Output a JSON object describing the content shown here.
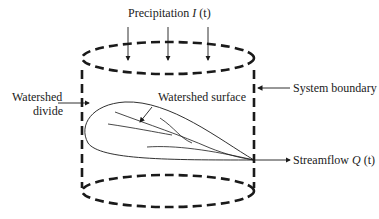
{
  "diagram": {
    "type": "watershed-system",
    "labels": {
      "precipitation": "Precipitation",
      "precipitation_symbol": "I",
      "precipitation_arg": "(t)",
      "watershed_divide_line1": "Watershed",
      "watershed_divide_line2": "divide",
      "watershed_surface": "Watershed surface",
      "system_boundary": "System boundary",
      "streamflow": "Streamflow",
      "streamflow_symbol": "Q",
      "streamflow_arg": "(t)"
    },
    "colors": {
      "stroke": "#1a1a1a",
      "background": "#ffffff"
    }
  }
}
